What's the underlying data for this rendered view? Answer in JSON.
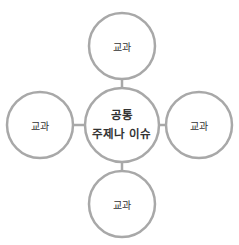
{
  "diagram": {
    "center": {
      "line1": "공통",
      "line2": "주제나 이슈"
    },
    "nodes": [
      {
        "position": "top",
        "label": "교과"
      },
      {
        "position": "left",
        "label": "교과"
      },
      {
        "position": "right",
        "label": "교과"
      },
      {
        "position": "bottom",
        "label": "교과"
      }
    ],
    "colors": {
      "stroke": "#a8a8a8",
      "text": "#333333",
      "background": "#ffffff"
    }
  }
}
